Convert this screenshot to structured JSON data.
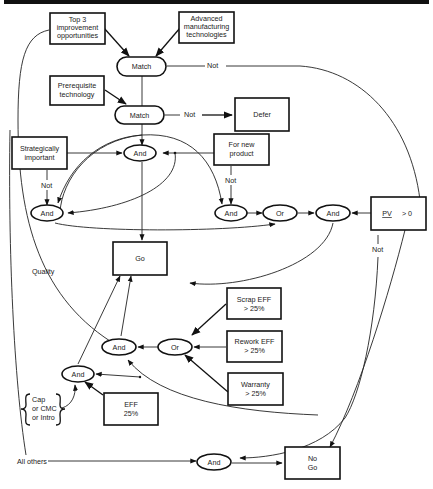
{
  "diagram": {
    "colors": {
      "ink": "#111111",
      "background": "#ffffff"
    },
    "boxes": {
      "top3": [
        "Top 3",
        "improvement",
        "opportunities"
      ],
      "advanced": [
        "Advanced",
        "manufacturing",
        "technologies"
      ],
      "prereq": [
        "Prerequisite",
        "technology"
      ],
      "defer": "Defer",
      "strategic": [
        "Strategically",
        "important"
      ],
      "newproduct": [
        "For new",
        "product"
      ],
      "go": "Go",
      "pv": {
        "var": "PV",
        "cond": "> 0"
      },
      "scrap": [
        "Scrap EFF",
        "> 25%"
      ],
      "rework": [
        "Rework EFF",
        "> 25%"
      ],
      "warranty": [
        "Warranty",
        "> 25%"
      ],
      "eff": [
        "EFF",
        "25%"
      ],
      "nogo": [
        "No",
        "Go"
      ]
    },
    "nodes": {
      "match1": "Match",
      "match2": "Match",
      "and_center": "And",
      "and_left": "And",
      "and_right": "And",
      "or_mid": "Or",
      "and_pv": "And",
      "and_quality": "And",
      "or_quality": "Or",
      "and_cap": "And",
      "and_bottom": "And"
    },
    "edge_labels": {
      "not_match1": "Not",
      "not_match2": "Not",
      "not_strategic": "Not",
      "not_newproduct": "Not",
      "not_pv": "Not",
      "quality": "Quality",
      "all_others": "All others"
    },
    "brace": [
      "Cap",
      "or CMC",
      "or Intro"
    ]
  }
}
